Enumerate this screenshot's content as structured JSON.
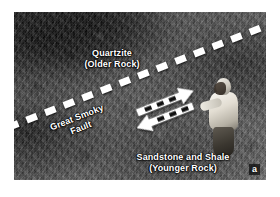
{
  "figure": {
    "panel_letter": "a",
    "photo": {
      "alt_name": "great-smoky-fault-outcrop-photo",
      "orientation": "landscape"
    }
  },
  "annotations": {
    "upper_unit": {
      "name": "Quartzite",
      "qualifier": "(Older Rock)"
    },
    "lower_unit": {
      "name": "Sandstone and Shale",
      "qualifier": "(Younger Rock)"
    },
    "fault": {
      "name": "Great Smoky",
      "kind": "Fault"
    }
  },
  "overlay_graphics": {
    "fault_trace_style": "white-dashed-line",
    "slip_indicator": "opposing-white-arrows",
    "colors": {
      "overlay_white": "#ffffff",
      "label_shadow": "#000000",
      "page_background": "#ffffff"
    }
  },
  "scale_object": {
    "name": "person-for-scale"
  }
}
